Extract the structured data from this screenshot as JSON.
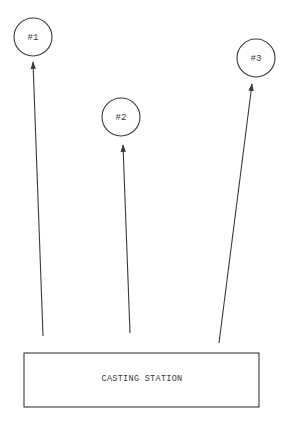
{
  "diagram": {
    "type": "flow",
    "source": {
      "label": "CASTING STATION"
    },
    "targets": [
      {
        "label": "#1"
      },
      {
        "label": "#2"
      },
      {
        "label": "#3"
      }
    ],
    "edges": [
      {
        "from": "CASTING STATION",
        "to": "#1",
        "direction": "up"
      },
      {
        "from": "CASTING STATION",
        "to": "#2",
        "direction": "up"
      },
      {
        "from": "CASTING STATION",
        "to": "#3",
        "direction": "up"
      }
    ]
  },
  "colors": {
    "ink": "#3a3a3a",
    "background": "#ffffff"
  }
}
